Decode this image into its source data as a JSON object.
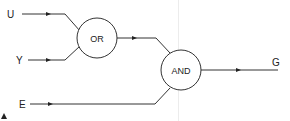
{
  "diagram": {
    "type": "logic-circuit",
    "inputs": [
      {
        "id": "U",
        "label": "U",
        "x": 6,
        "y": 14
      },
      {
        "id": "Y",
        "label": "Y",
        "x": 14,
        "y": 60
      },
      {
        "id": "E",
        "label": "E",
        "x": 19,
        "y": 104
      }
    ],
    "gates": [
      {
        "id": "or_gate",
        "label": "OR",
        "cx": 97,
        "cy": 38,
        "r": 20,
        "inputs": [
          "U",
          "Y"
        ]
      },
      {
        "id": "and_gate",
        "label": "AND",
        "cx": 181,
        "cy": 70,
        "r": 20,
        "inputs": [
          "or_gate",
          "E"
        ]
      }
    ],
    "outputs": [
      {
        "id": "G",
        "label": "G",
        "x": 272,
        "y": 62,
        "from": "and_gate"
      }
    ],
    "colors": {
      "line": "#333333",
      "text": "#222222",
      "guide": "#ececec"
    }
  }
}
